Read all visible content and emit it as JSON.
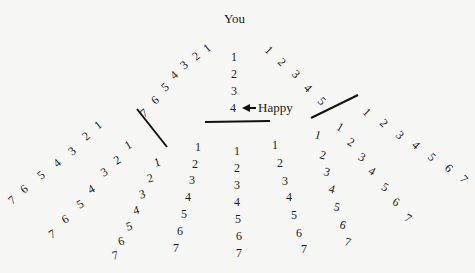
{
  "title": "You",
  "annotation": "Happy",
  "branches": [
    {
      "name": "top-left",
      "rotate": -40,
      "points": [
        [
          207,
          48
        ],
        [
          196,
          56
        ],
        [
          184,
          65
        ],
        [
          174,
          75
        ],
        [
          165,
          87
        ],
        [
          155,
          100
        ],
        [
          144,
          113
        ]
      ],
      "labels": [
        "1",
        "2",
        "3",
        "4",
        "5",
        "6",
        "7"
      ]
    },
    {
      "name": "top-center",
      "rotate": 0,
      "points": [
        [
          234,
          57
        ],
        [
          234,
          74
        ],
        [
          234,
          91
        ],
        [
          233,
          108
        ]
      ],
      "labels": [
        "1",
        "2",
        "3",
        "4"
      ]
    },
    {
      "name": "top-right",
      "rotate": 45,
      "points": [
        [
          269,
          50
        ],
        [
          282,
          62
        ],
        [
          296,
          74
        ],
        [
          308,
          88
        ],
        [
          322,
          101
        ]
      ],
      "labels": [
        "1",
        "2",
        "3",
        "4",
        "5"
      ]
    },
    {
      "name": "left-1",
      "rotate": -40,
      "points": [
        [
          98,
          125
        ],
        [
          86,
          136
        ],
        [
          72,
          151
        ],
        [
          57,
          163
        ],
        [
          41,
          175
        ],
        [
          24,
          189
        ],
        [
          12,
          200
        ]
      ],
      "labels": [
        "1",
        "2",
        "3",
        "4",
        "5",
        "6",
        "7"
      ]
    },
    {
      "name": "left-2",
      "rotate": -30,
      "points": [
        [
          128,
          145
        ],
        [
          117,
          160
        ],
        [
          104,
          172
        ],
        [
          91,
          189
        ],
        [
          80,
          204
        ],
        [
          65,
          219
        ],
        [
          52,
          234
        ]
      ],
      "labels": [
        "1",
        "2",
        "3",
        "4",
        "5",
        "6",
        "7"
      ]
    },
    {
      "name": "left-3",
      "rotate": -15,
      "points": [
        [
          157,
          162
        ],
        [
          150,
          178
        ],
        [
          142,
          194
        ],
        [
          136,
          210
        ],
        [
          129,
          226
        ],
        [
          121,
          241
        ],
        [
          115,
          255
        ]
      ],
      "labels": [
        "1",
        "2",
        "3",
        "4",
        "5",
        "6",
        "7"
      ]
    },
    {
      "name": "center-left",
      "rotate": 0,
      "points": [
        [
          198,
          147
        ],
        [
          195,
          164
        ],
        [
          192,
          180
        ],
        [
          188,
          197
        ],
        [
          184,
          214
        ],
        [
          180,
          231
        ],
        [
          176,
          248
        ]
      ],
      "labels": [
        "1",
        "2",
        "3",
        "4",
        "5",
        "6",
        "7"
      ]
    },
    {
      "name": "center",
      "rotate": 0,
      "points": [
        [
          237,
          151
        ],
        [
          237,
          168
        ],
        [
          237,
          185
        ],
        [
          237,
          202
        ],
        [
          238,
          219
        ],
        [
          239,
          236
        ],
        [
          239,
          253
        ]
      ],
      "labels": [
        "1",
        "2",
        "3",
        "4",
        "5",
        "6",
        "7"
      ]
    },
    {
      "name": "right-1",
      "rotate": 0,
      "points": [
        [
          275,
          145
        ],
        [
          280,
          163
        ],
        [
          285,
          181
        ],
        [
          289,
          197
        ],
        [
          294,
          215
        ],
        [
          299,
          233
        ],
        [
          304,
          249
        ]
      ],
      "labels": [
        "1",
        "2",
        "3",
        "4",
        "5",
        "6",
        "7"
      ]
    },
    {
      "name": "right-2",
      "rotate": 15,
      "points": [
        [
          318,
          135
        ],
        [
          323,
          155
        ],
        [
          327,
          172
        ],
        [
          332,
          189
        ],
        [
          337,
          207
        ],
        [
          343,
          225
        ],
        [
          348,
          242
        ]
      ],
      "labels": [
        "1",
        "2",
        "3",
        "4",
        "5",
        "6",
        "7"
      ]
    },
    {
      "name": "right-3",
      "rotate": 30,
      "points": [
        [
          340,
          127
        ],
        [
          351,
          142
        ],
        [
          362,
          157
        ],
        [
          372,
          171
        ],
        [
          385,
          187
        ],
        [
          396,
          202
        ],
        [
          408,
          218
        ]
      ],
      "labels": [
        "1",
        "2",
        "3",
        "4",
        "5",
        "6",
        "7"
      ]
    },
    {
      "name": "right-4",
      "rotate": 45,
      "points": [
        [
          367,
          112
        ],
        [
          384,
          123
        ],
        [
          400,
          135
        ],
        [
          416,
          145
        ],
        [
          432,
          157
        ],
        [
          449,
          168
        ],
        [
          464,
          179
        ]
      ],
      "labels": [
        "1",
        "2",
        "3",
        "4",
        "5",
        "6",
        "7"
      ]
    }
  ],
  "bars": [
    {
      "name": "left-bar",
      "x1": 137,
      "y1": 109,
      "x2": 167,
      "y2": 147
    },
    {
      "name": "center-bar",
      "x1": 205,
      "y1": 122,
      "x2": 270,
      "y2": 121
    },
    {
      "name": "right-bar",
      "x1": 311,
      "y1": 118,
      "x2": 358,
      "y2": 95
    }
  ],
  "arrow": {
    "x1": 256,
    "y1": 108,
    "x2": 242,
    "y2": 108
  }
}
